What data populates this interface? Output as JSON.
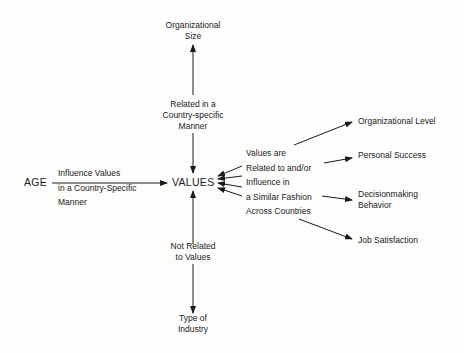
{
  "diagram": {
    "center_node": "VALUES",
    "top": {
      "node_lines": [
        "Organizational",
        "Size"
      ],
      "relation_lines": [
        "Related in a",
        "Country-specific",
        "Manner"
      ]
    },
    "left": {
      "node": "AGE",
      "relation_lines": [
        "Influence Values",
        "in a Country-Specific",
        "Manner"
      ]
    },
    "bottom": {
      "relation_lines": [
        "Not Related",
        "to Values"
      ],
      "node_lines": [
        "Type of",
        "Industry"
      ]
    },
    "right": {
      "relation_lines": [
        "Values are",
        "Related to and/or",
        "Influence in",
        "a Similar Fashion",
        "Across Countries"
      ],
      "targets": [
        {
          "lines": [
            "Organizational Level"
          ]
        },
        {
          "lines": [
            "Personal Success"
          ]
        },
        {
          "lines": [
            "Decisionmaking",
            "Behavior"
          ]
        },
        {
          "lines": [
            "Job Satisfaction"
          ]
        }
      ]
    }
  },
  "colors": {
    "ink": "#1a1a1a",
    "background": "#fdfdfc"
  }
}
